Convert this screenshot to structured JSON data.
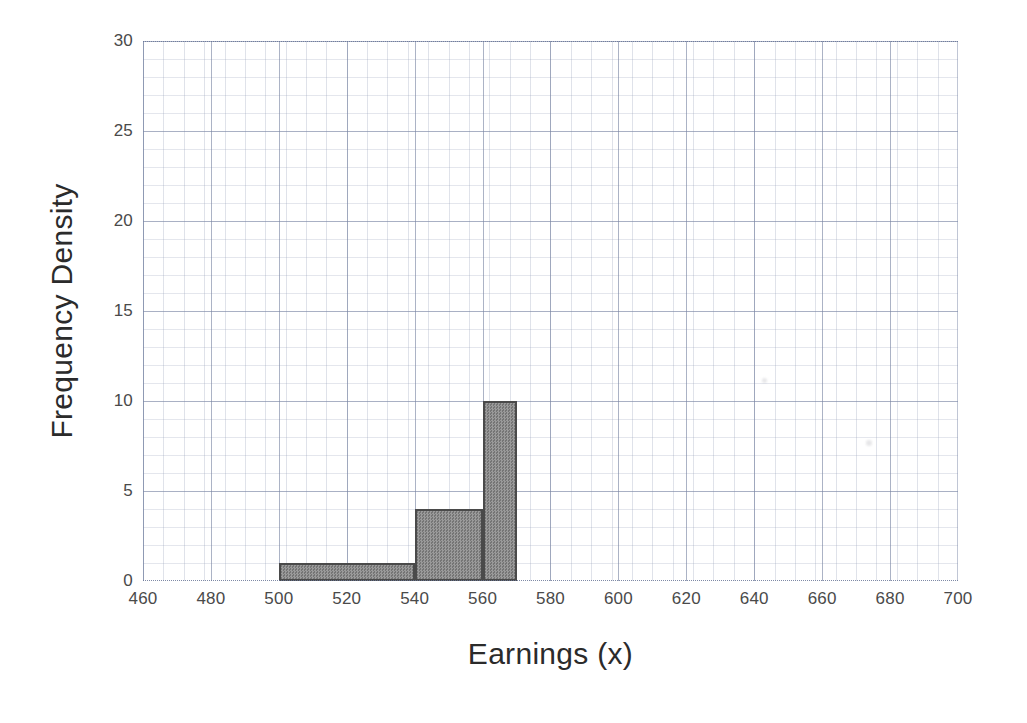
{
  "chart_data": {
    "type": "bar",
    "title": "",
    "subtitle": "",
    "xlabel": "Earnings (x)",
    "ylabel": "Frequency Density",
    "xlim": [
      460,
      700
    ],
    "ylim": [
      0,
      30
    ],
    "x_major_step": 20,
    "y_major_step": 5,
    "x_minor_step": 4,
    "y_minor_step": 1,
    "grid": true,
    "grid_style": "graph-paper minor and major gridlines",
    "legend": null,
    "legend_position": "none",
    "xticks": [
      460,
      480,
      500,
      520,
      540,
      560,
      580,
      600,
      620,
      640,
      660,
      680,
      700
    ],
    "xtick_labels": [
      "460",
      "480",
      "500",
      "520",
      "540",
      "560",
      "580",
      "600",
      "620",
      "640",
      "660",
      "680",
      "700"
    ],
    "yticks": [
      0,
      5,
      10,
      15,
      20,
      25,
      30
    ],
    "ytick_labels": [
      "0",
      "5",
      "10",
      "15",
      "20",
      "25",
      "30"
    ],
    "bar_style": {
      "fill": "#8c8c8c",
      "fill_pattern": "fine gray dither / checkerboard hatch",
      "edge_color": "#4a4a4a",
      "edge_width": 2.2
    },
    "bins": [
      {
        "label": "500-540",
        "x_start": 500,
        "x_end": 540,
        "frequency_density": 1
      },
      {
        "label": "540-560",
        "x_start": 540,
        "x_end": 560,
        "frequency_density": 4
      },
      {
        "label": "560-570",
        "x_start": 560,
        "x_end": 570,
        "frequency_density": 10
      }
    ],
    "categories": [
      "500-540",
      "540-560",
      "560-570"
    ],
    "values": [
      1,
      4,
      10
    ]
  },
  "artifacts": [
    {
      "name": "smudge-right-upper",
      "left": 762,
      "top": 378,
      "size": 5
    },
    {
      "name": "smudge-right-lower",
      "left": 866,
      "top": 440,
      "size": 6
    }
  ]
}
